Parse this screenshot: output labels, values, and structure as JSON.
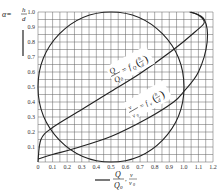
{
  "chart_data": {
    "type": "line",
    "title": "",
    "ylabel": "α = h/d",
    "xlabel": "Q/Q0 , v/v0",
    "xlim": [
      0,
      1.2
    ],
    "ylim": [
      0,
      1.0
    ],
    "grid": true,
    "grid_step": 0.05,
    "x_ticks": [
      "0",
      "0.1",
      "0.2",
      "0.3",
      "0.4",
      "0.5",
      "0.6",
      "0.7",
      "0.8",
      "0.9",
      "1.0",
      "1.1",
      "1.2"
    ],
    "y_ticks": [
      "0.1",
      "0.2",
      "0.3",
      "0.4",
      "0.5",
      "0.6",
      "0.7",
      "0.8",
      "0.9",
      "1.0"
    ],
    "series": [
      {
        "name": "Q/Q0 = fQ(h/d)",
        "x": [
          0.0,
          0.02,
          0.1,
          0.3,
          0.5,
          0.7,
          0.93,
          1.08,
          1.14,
          1.1,
          1.04
        ],
        "y": [
          0.0,
          0.15,
          0.23,
          0.35,
          0.47,
          0.59,
          0.75,
          0.87,
          0.93,
          0.98,
          1.0
        ]
      },
      {
        "name": "v/v0 = fv(h/d)",
        "x": [
          0.0,
          0.1,
          0.25,
          0.5,
          0.75,
          0.93,
          1.0,
          1.1,
          1.16,
          1.14,
          1.05
        ],
        "y": [
          0.02,
          0.05,
          0.09,
          0.17,
          0.29,
          0.4,
          0.47,
          0.6,
          0.8,
          0.95,
          1.0
        ]
      },
      {
        "name": "pipe cross-section circle",
        "center": [
          0.5,
          0.5
        ],
        "radius_y": 0.5,
        "x_range": [
          0.0,
          1.0
        ]
      }
    ],
    "annotations": [
      "Q/Q0 = fQ(h/d)",
      "v/v0 = fv(h/d)"
    ]
  },
  "labels": {
    "y_axis_alpha": "α=",
    "y_axis_h": "h",
    "y_axis_d": "d",
    "x_axis_Q": "Q",
    "x_axis_Q0": "Q",
    "x_axis_v": "v",
    "x_axis_v0": "v",
    "sub0": "0",
    "arrow": "⟶",
    "comma": ",",
    "ann_q_num": "Q",
    "ann_q_den": "Q",
    "ann_q_eq": "= f",
    "ann_q_sub": "Q",
    "ann_v_num": "v",
    "ann_v_den": "v",
    "ann_v_eq": "= f",
    "ann_v_sub": "v",
    "frac_h": "h",
    "frac_d": "d"
  }
}
